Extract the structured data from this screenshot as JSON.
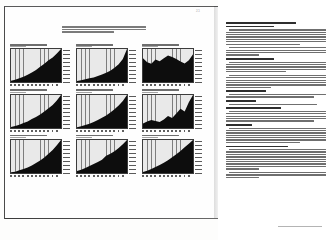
{
  "document": {
    "type": "scanned-annual-report-spread",
    "folio": "23",
    "left_page": {
      "intro_paragraph_lines": 3,
      "chart_count": 9
    }
  },
  "chart_data": [
    {
      "type": "area",
      "title": "Revenues",
      "subtitle": "(in thousands)",
      "xlabel": "",
      "ylabel": "",
      "grid": true,
      "legend": "none",
      "categories": [
        "86",
        "87",
        "88",
        "89",
        "90",
        "91",
        "92",
        "93",
        "94",
        "95",
        "96",
        "97",
        "98"
      ],
      "values": [
        4,
        7,
        11,
        16,
        22,
        29,
        36,
        46,
        55,
        66,
        74,
        86,
        100
      ],
      "ylim": [
        0,
        100
      ]
    },
    {
      "type": "area",
      "title": "Net Income",
      "subtitle": "(in thousands)",
      "xlabel": "",
      "ylabel": "",
      "grid": true,
      "legend": "none",
      "categories": [
        "86",
        "87",
        "88",
        "89",
        "90",
        "91",
        "92",
        "93",
        "94",
        "95",
        "96",
        "97",
        "98"
      ],
      "values": [
        3,
        5,
        8,
        11,
        14,
        18,
        23,
        28,
        34,
        43,
        54,
        70,
        100
      ],
      "ylim": [
        0,
        100
      ]
    },
    {
      "type": "area",
      "title": "Net Income as a Percentage of Revenues",
      "subtitle": "(percent)",
      "xlabel": "",
      "ylabel": "",
      "grid": true,
      "legend": "none",
      "categories": [
        "86",
        "87",
        "88",
        "89",
        "90",
        "91",
        "92",
        "93",
        "94",
        "95",
        "96",
        "97",
        "98"
      ],
      "values": [
        72,
        60,
        55,
        68,
        63,
        72,
        80,
        76,
        70,
        62,
        56,
        66,
        84
      ],
      "ylim": [
        0,
        100
      ]
    },
    {
      "type": "area",
      "title": "Shareholders' Equity",
      "subtitle": "(in thousands)",
      "xlabel": "",
      "ylabel": "",
      "grid": true,
      "legend": "none",
      "categories": [
        "86",
        "87",
        "88",
        "89",
        "90",
        "91",
        "92",
        "93",
        "94",
        "95",
        "96",
        "97",
        "98"
      ],
      "values": [
        3,
        6,
        10,
        15,
        20,
        27,
        33,
        41,
        50,
        60,
        70,
        83,
        100
      ],
      "ylim": [
        0,
        100
      ]
    },
    {
      "type": "area",
      "title": "Total Stockholders' Return",
      "subtitle": "(index)",
      "xlabel": "",
      "ylabel": "",
      "grid": true,
      "legend": "none",
      "categories": [
        "86",
        "87",
        "88",
        "89",
        "90",
        "91",
        "92",
        "93",
        "94",
        "95",
        "96",
        "97",
        "98"
      ],
      "values": [
        2,
        5,
        9,
        13,
        18,
        24,
        31,
        38,
        47,
        57,
        68,
        82,
        100
      ],
      "ylim": [
        0,
        100
      ]
    },
    {
      "type": "area",
      "title": "Research and Development Expense",
      "subtitle": "(in thousands)",
      "xlabel": "",
      "ylabel": "",
      "grid": true,
      "legend": "none",
      "categories": [
        "86",
        "87",
        "88",
        "89",
        "90",
        "91",
        "92",
        "93",
        "94",
        "95",
        "96",
        "97",
        "98"
      ],
      "values": [
        14,
        20,
        24,
        21,
        18,
        26,
        36,
        30,
        44,
        58,
        50,
        78,
        100
      ],
      "ylim": [
        0,
        100
      ]
    },
    {
      "type": "area",
      "title": "Employees at Year End",
      "subtitle": "(number)",
      "xlabel": "",
      "ylabel": "",
      "grid": true,
      "legend": "none",
      "categories": [
        "86",
        "87",
        "88",
        "89",
        "90",
        "91",
        "92",
        "93",
        "94",
        "95",
        "96",
        "97",
        "98"
      ],
      "values": [
        2,
        4,
        8,
        12,
        17,
        23,
        30,
        38,
        47,
        58,
        70,
        84,
        100
      ],
      "ylim": [
        0,
        100
      ]
    },
    {
      "type": "area",
      "title": "Operating Income",
      "subtitle": "(in thousands)",
      "xlabel": "",
      "ylabel": "",
      "grid": true,
      "legend": "none",
      "categories": [
        "86",
        "87",
        "88",
        "89",
        "90",
        "91",
        "92",
        "93",
        "94",
        "95",
        "96",
        "97",
        "98"
      ],
      "values": [
        6,
        10,
        15,
        21,
        27,
        33,
        40,
        52,
        58,
        66,
        76,
        87,
        100
      ],
      "ylim": [
        0,
        100
      ]
    },
    {
      "type": "area",
      "title": "Cash and Investments",
      "subtitle": "(in thousands)",
      "xlabel": "",
      "ylabel": "",
      "grid": true,
      "legend": "none",
      "categories": [
        "86",
        "87",
        "88",
        "89",
        "90",
        "91",
        "92",
        "93",
        "94",
        "95",
        "96",
        "97",
        "98"
      ],
      "values": [
        3,
        7,
        12,
        18,
        24,
        31,
        39,
        48,
        57,
        67,
        78,
        89,
        100
      ],
      "ylim": [
        0,
        100
      ]
    }
  ],
  "right_page": {
    "sections": [
      {
        "heading_lines": 2,
        "paragraphs": [
          7,
          4
        ]
      },
      {
        "heading_lines": 1,
        "paragraphs": [
          5,
          6
        ]
      },
      {
        "heading_lines": 1,
        "paragraphs": [
          2
        ]
      },
      {
        "heading_lines": 1,
        "paragraphs": [
          1
        ]
      },
      {
        "heading_lines": 1,
        "paragraphs": [
          5
        ]
      },
      {
        "heading_lines": 1,
        "paragraphs": [
          7
        ]
      },
      {
        "heading_lines": 1,
        "paragraphs": [
          9,
          3
        ]
      }
    ]
  }
}
